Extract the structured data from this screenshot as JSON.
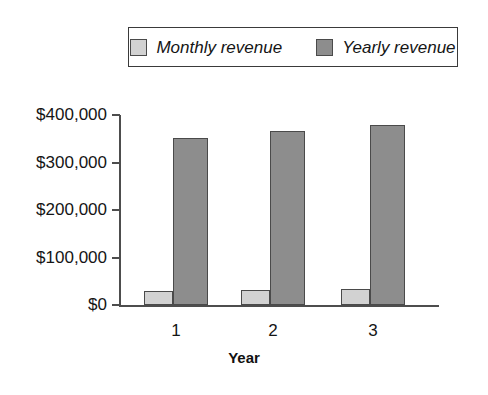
{
  "chart_data": {
    "type": "bar",
    "title": "",
    "xlabel": "Year",
    "ylabel": "",
    "categories": [
      "1",
      "2",
      "3"
    ],
    "series": [
      {
        "name": "Monthly revenue",
        "values": [
          29000,
          32000,
          34000
        ],
        "color": "#d2d2d2"
      },
      {
        "name": "Yearly revenue",
        "values": [
          351000,
          366000,
          379000
        ],
        "color": "#8d8d8d"
      }
    ],
    "ylim": [
      0,
      400000
    ],
    "yticks": [
      0,
      100000,
      200000,
      300000,
      400000
    ],
    "ytick_labels": [
      "$0",
      "$100,000",
      "$200,000",
      "$300,000",
      "$400,000"
    ],
    "grid": false,
    "legend_position": "top"
  },
  "legend": {
    "entries": [
      {
        "label": "Monthly revenue"
      },
      {
        "label": "Yearly revenue"
      }
    ]
  },
  "axes": {
    "x_title": "Year",
    "categories": [
      {
        "label": "1"
      },
      {
        "label": "2"
      },
      {
        "label": "3"
      }
    ],
    "y_ticks": [
      {
        "label": "$400,000"
      },
      {
        "label": "$300,000"
      },
      {
        "label": "$200,000"
      },
      {
        "label": "$100,000"
      },
      {
        "label": "$0"
      }
    ]
  }
}
